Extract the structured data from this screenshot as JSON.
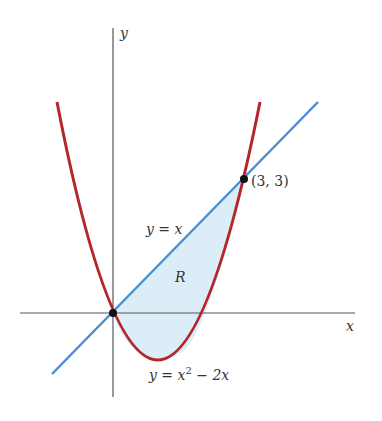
{
  "figure": {
    "axes": {
      "x_label": "x",
      "y_label": "y"
    },
    "curves": [
      {
        "name": "parabola",
        "label": "y = x² − 2x",
        "label_main": "y = x",
        "label_sup": "2",
        "label_tail": " − 2x",
        "color": "#b5262b"
      },
      {
        "name": "line",
        "label": "y = x",
        "color": "#4a8fd6"
      }
    ],
    "region": {
      "label": "R",
      "fill": "#dbeef8"
    },
    "points": [
      {
        "coords": "(3, 3)",
        "x": 3,
        "y": 3
      },
      {
        "coords": "(0, 0)",
        "x": 0,
        "y": 0
      }
    ]
  }
}
